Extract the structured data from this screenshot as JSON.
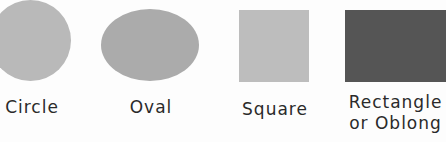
{
  "figure": {
    "shapes": [
      {
        "id": "circle",
        "label": "Circle",
        "color": "#b9b9b9"
      },
      {
        "id": "oval",
        "label": "Oval",
        "color": "#ababab"
      },
      {
        "id": "square",
        "label": "Square",
        "color": "#bdbdbd"
      },
      {
        "id": "rectangle",
        "label_line1": "Rectangle",
        "label_line2": "or Oblong",
        "color": "#555555"
      }
    ]
  }
}
